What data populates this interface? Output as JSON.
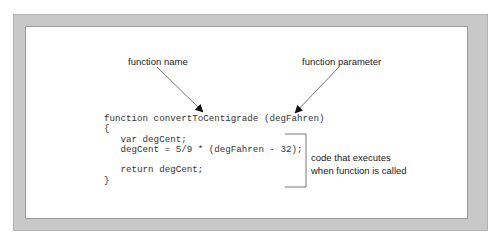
{
  "diagram": {
    "labels": {
      "function_name": "function name",
      "function_parameter": "function parameter",
      "body_callout_line1": "code that executes",
      "body_callout_line2": "when function is called"
    },
    "code": {
      "lines": [
        "function convertToCentigrade (degFahren)",
        "{",
        "   var degCent;",
        "   degCent = 5/9 * (degFahren - 32);",
        "",
        "   return degCent;",
        "}"
      ]
    },
    "colors": {
      "frame": "#c8c8c8",
      "text": "#222222",
      "arrow": "#555555"
    }
  }
}
